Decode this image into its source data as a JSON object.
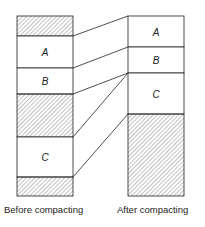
{
  "diagram": {
    "before": {
      "caption": "Before compacting",
      "segments": [
        {
          "type": "free",
          "label": ""
        },
        {
          "type": "used",
          "label": "A"
        },
        {
          "type": "used",
          "label": "B"
        },
        {
          "type": "free",
          "label": ""
        },
        {
          "type": "used",
          "label": "C"
        },
        {
          "type": "free",
          "label": ""
        }
      ]
    },
    "after": {
      "caption": "After compacting",
      "segments": [
        {
          "type": "used",
          "label": "A"
        },
        {
          "type": "used",
          "label": "B"
        },
        {
          "type": "used",
          "label": "C"
        },
        {
          "type": "free",
          "label": ""
        }
      ]
    },
    "colors": {
      "stroke": "#222222",
      "hatch": "#555555",
      "background": "#ffffff"
    }
  }
}
